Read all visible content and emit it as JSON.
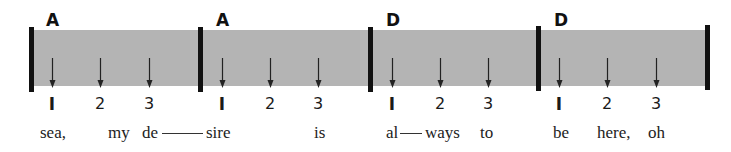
{
  "diagram": {
    "band_color": "#b4b4b4",
    "measures": [
      {
        "chord": "A",
        "beats": [
          "I",
          "2",
          "3"
        ]
      },
      {
        "chord": "A",
        "beats": [
          "I",
          "2",
          "3"
        ]
      },
      {
        "chord": "D",
        "beats": [
          "I",
          "2",
          "3"
        ]
      },
      {
        "chord": "D",
        "beats": [
          "I",
          "2",
          "3"
        ]
      }
    ],
    "lyrics": [
      "sea,",
      "my",
      "de",
      "sire",
      "is",
      "al",
      "ways",
      "to",
      "be",
      "here,",
      "oh"
    ]
  }
}
